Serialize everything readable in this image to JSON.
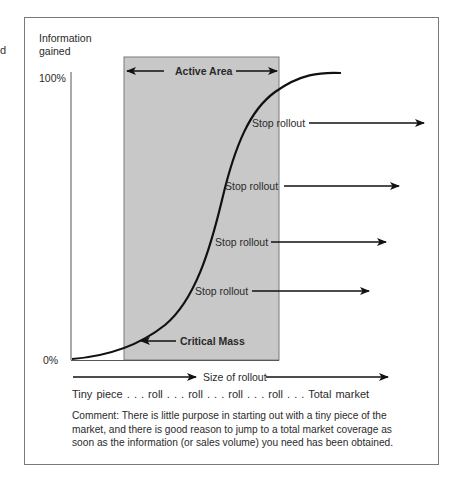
{
  "edge_fragment": "d",
  "y_axis": {
    "label_line1": "Information",
    "label_line2": "gained",
    "top_tick": "100%",
    "bottom_tick": "0%"
  },
  "active_area": {
    "label": "Active Area",
    "fill_color": "#c8c8c8"
  },
  "curve": {
    "type": "s-curve",
    "annotation": "Critical Mass"
  },
  "stop_rollout_labels": [
    {
      "label": "Stop rollout"
    },
    {
      "label": "Stop rollout"
    },
    {
      "label": "Stop rollout"
    },
    {
      "label": "Stop rollout"
    }
  ],
  "x_axis": {
    "label": "Size of rollout",
    "scale_text": "Tiny piece . . . roll . . . roll . . . roll . . . roll . . . Total market"
  },
  "comment": "Comment:  There is little purpose in starting out with a tiny piece of the market, and there is good reason to jump to a total market coverage as soon as the information (or sales volume) you need has been obtained."
}
